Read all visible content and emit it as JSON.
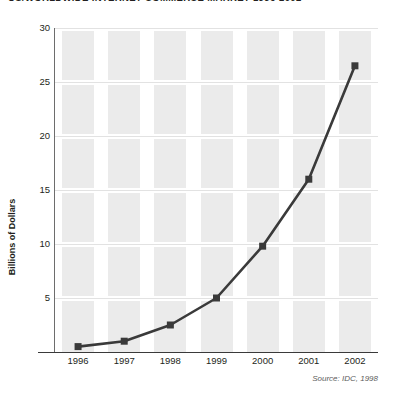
{
  "title": "US/WORLDWIDE INTERNET COMMERCE MARKET 1996-2002",
  "source_note": "Source: IDC, 1998",
  "colors": {
    "line": "#3a3a3a",
    "marker": "#3a3a3a",
    "band": "#ebebeb",
    "gridline": "#e2e2e2",
    "axis": "#3a3a3a",
    "text": "#231f20"
  },
  "chart_data": {
    "type": "line",
    "title": "US/WORLDWIDE INTERNET COMMERCE MARKET 1996-2002",
    "xlabel": "",
    "ylabel": "Billions of Dollars",
    "categories": [
      "1996",
      "1997",
      "1998",
      "1999",
      "2000",
      "2001",
      "2002"
    ],
    "values": [
      0.5,
      1.0,
      2.5,
      5.0,
      9.8,
      16.0,
      26.5
    ],
    "ylim": [
      0,
      30
    ],
    "yticks": [
      5,
      10,
      15,
      20,
      25,
      30
    ],
    "ytick_labels": [
      "5",
      "10",
      "15",
      "20",
      "25",
      "30"
    ],
    "xtick_labels": [
      "1996",
      "1997",
      "1998",
      "1999",
      "2000",
      "2001",
      "2002"
    ],
    "grid": true,
    "legend": false,
    "marker": "square",
    "series": [
      {
        "name": "Internet commerce market",
        "values": [
          0.5,
          1.0,
          2.5,
          5.0,
          9.8,
          16.0,
          26.5
        ]
      }
    ]
  }
}
